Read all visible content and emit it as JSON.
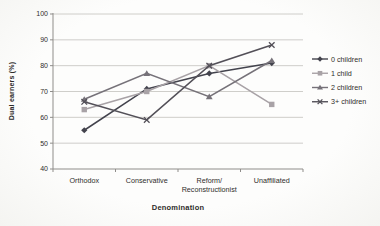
{
  "chart_data": {
    "type": "line",
    "title": "",
    "xlabel": "Denomination",
    "ylabel": "Dual earners (%)",
    "ylim": [
      40,
      100
    ],
    "yticks": [
      40,
      50,
      60,
      70,
      80,
      90,
      100
    ],
    "grid": true,
    "legend_position": "right",
    "categories": [
      "Orthodox",
      "Conservative",
      "Reform/\nReconstructionist",
      "Unaffiliated"
    ],
    "series": [
      {
        "name": "0 children",
        "marker": "diamond",
        "color": "#43434d",
        "values": [
          55,
          71,
          77,
          81
        ]
      },
      {
        "name": "1 child",
        "marker": "square",
        "color": "#a8a2a6",
        "values": [
          63,
          70,
          80,
          65
        ]
      },
      {
        "name": "2 children",
        "marker": "triangle",
        "color": "#767279",
        "values": [
          67,
          77,
          68,
          82
        ]
      },
      {
        "name": "3+ children",
        "marker": "xstar",
        "color": "#535058",
        "values": [
          66,
          59,
          80,
          88
        ]
      }
    ],
    "colors": {
      "axis": "#8f8d8a",
      "grid": "#c9c8c4",
      "text": "#2f2d2b"
    }
  }
}
